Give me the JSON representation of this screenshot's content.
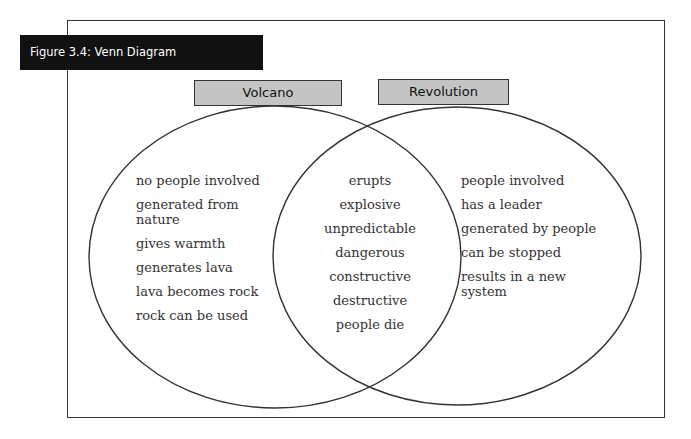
{
  "figure": {
    "title": "Figure 3.4: Venn Diagram",
    "top_cut_text": "…on diagram"
  },
  "sets": {
    "left": {
      "label": "Volcano",
      "items": [
        "no people involved",
        "generated from\nnature",
        "gives warmth",
        "generates lava",
        "lava becomes rock",
        "rock can be used"
      ]
    },
    "intersection": {
      "items": [
        "erupts",
        "explosive",
        "unpredictable",
        "dangerous",
        "constructive",
        "destructive",
        "people die"
      ]
    },
    "right": {
      "label": "Revolution",
      "items": [
        "people involved",
        "has a leader",
        "generated by people",
        "can be stopped",
        "results in a new\nsystem"
      ]
    }
  },
  "colors": {
    "title_bg": "#111111",
    "label_bg": "#c4c4c4",
    "stroke": "#333333"
  }
}
